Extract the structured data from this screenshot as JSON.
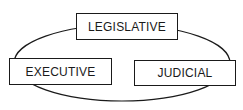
{
  "diagram": {
    "type": "separation-of-powers",
    "branches": [
      {
        "id": "legislative",
        "label": "LEGISLATIVE"
      },
      {
        "id": "executive",
        "label": "EXECUTIVE"
      },
      {
        "id": "judicial",
        "label": "JUDICIAL"
      }
    ],
    "connector": {
      "shape": "ellipse",
      "connects": [
        "legislative",
        "executive",
        "judicial"
      ]
    },
    "colors": {
      "stroke": "#1a1a1a",
      "background": "#ffffff",
      "text": "#1a1a1a"
    }
  }
}
